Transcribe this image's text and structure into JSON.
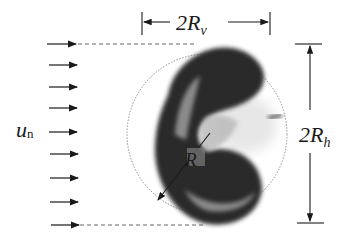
{
  "diagram": {
    "type": "schematic",
    "labels": {
      "flow_velocity": "u",
      "flow_velocity_sub": "n",
      "vertical_extent": "2R",
      "vertical_extent_sub": "v",
      "horizontal_extent": "2R",
      "horizontal_extent_sub": "h",
      "radius": "R"
    },
    "flow_arrows": 9,
    "colors": {
      "ink": "#1a1a1a",
      "drop_dark": "#2b2b2b",
      "drop_light": "#8a8a8a",
      "circle": "#777777"
    }
  }
}
